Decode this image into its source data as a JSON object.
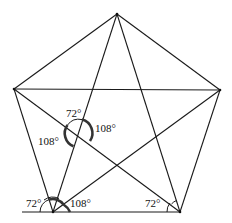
{
  "diagram": {
    "title": "",
    "vertices": [
      "top",
      "left",
      "right",
      "bottom-left",
      "bottom-right"
    ],
    "labels": {
      "center_top": "72°",
      "center_left": "108°",
      "center_right": "108°",
      "bottom_left_outer": "72°",
      "bottom_left_inner": "108°",
      "bottom_right": "72°"
    }
  }
}
